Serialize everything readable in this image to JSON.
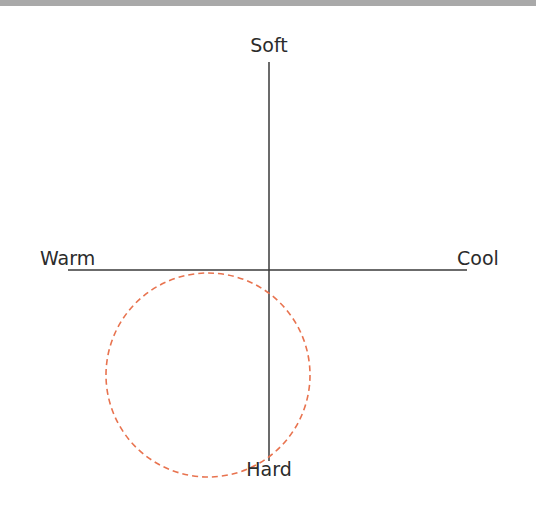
{
  "diagram": {
    "type": "quadrant-axes",
    "axes": {
      "vertical": {
        "top_label": "Soft",
        "bottom_label": "Hard"
      },
      "horizontal": {
        "left_label": "Warm",
        "right_label": "Cool"
      }
    },
    "highlight": {
      "shape": "dashed-circle",
      "quadrant": "lower-left (Warm / Hard)",
      "color": "#e8734f"
    },
    "colors": {
      "axis_line": "#3a3a3a",
      "top_band": "#a9a9a9",
      "text": "#2b2b2b"
    }
  }
}
